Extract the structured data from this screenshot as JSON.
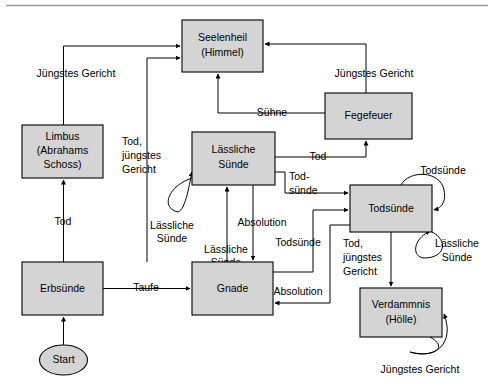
{
  "diagram": {
    "top_rule": true,
    "background_color": "#ffffff",
    "node_fill_color": "#d4d4d4",
    "node_stroke_color": "#000000",
    "edge_color": "#000000",
    "nodes": [
      {
        "id": "start",
        "shape": "ellipse",
        "lines": [
          "Start"
        ],
        "x": 40,
        "y": 345,
        "w": 47,
        "h": 30
      },
      {
        "id": "erbsuende",
        "shape": "rect",
        "lines": [
          "Erbsünde"
        ],
        "x": 22,
        "y": 262,
        "w": 81,
        "h": 53
      },
      {
        "id": "limbus",
        "shape": "rect",
        "lines": [
          "Limbus",
          "(Abrahams",
          "Schoss)"
        ],
        "x": 22,
        "y": 125,
        "w": 81,
        "h": 53
      },
      {
        "id": "seelenheil",
        "shape": "rect",
        "lines": [
          "Seelenheil",
          "(Himmel)"
        ],
        "x": 182,
        "y": 20,
        "w": 81,
        "h": 52
      },
      {
        "id": "fegefeuer",
        "shape": "rect",
        "lines": [
          "Fegefeuer"
        ],
        "x": 325,
        "y": 93,
        "w": 87,
        "h": 46
      },
      {
        "id": "laessliche",
        "shape": "rect",
        "lines": [
          "Lässliche",
          "Sünde"
        ],
        "x": 192,
        "y": 132,
        "w": 83,
        "h": 53
      },
      {
        "id": "gnade",
        "shape": "rect",
        "lines": [
          "Gnade"
        ],
        "x": 192,
        "y": 262,
        "w": 81,
        "h": 53
      },
      {
        "id": "todsuende",
        "shape": "rect",
        "lines": [
          "Todsünde"
        ],
        "x": 350,
        "y": 185,
        "w": 82,
        "h": 47
      },
      {
        "id": "verdammnis",
        "shape": "rect",
        "lines": [
          "Verdammnis",
          "(Hölle)"
        ],
        "x": 360,
        "y": 288,
        "w": 82,
        "h": 49
      }
    ],
    "edges": [
      {
        "id": "start-to-erbsuende",
        "from": "start",
        "to": "erbsuende",
        "label": ""
      },
      {
        "id": "erbsuende-to-limbus",
        "from": "erbsuende",
        "to": "limbus",
        "label": "Tod"
      },
      {
        "id": "limbus-to-seelenheil",
        "from": "limbus",
        "to": "seelenheil",
        "label": "Jüngstes Gericht"
      },
      {
        "id": "erbsuende-to-gnade",
        "from": "erbsuende",
        "to": "gnade",
        "label": "Taufe"
      },
      {
        "id": "gnade-to-seelenheil",
        "from": "gnade",
        "to": "seelenheil",
        "label": "Tod, jüngstes Gericht"
      },
      {
        "id": "gnade-to-laessliche",
        "from": "gnade",
        "to": "laessliche",
        "label": "Lässliche Sünde"
      },
      {
        "id": "laessliche-self",
        "from": "laessliche",
        "to": "laessliche",
        "label": "Lässliche Sünde"
      },
      {
        "id": "laessliche-to-gnade",
        "from": "laessliche",
        "to": "gnade",
        "label": "Absolution"
      },
      {
        "id": "laessliche-to-fegefeuer",
        "from": "laessliche",
        "to": "fegefeuer",
        "label": "Tod"
      },
      {
        "id": "laessliche-to-todsuende",
        "from": "laessliche",
        "to": "todsuende",
        "label": "Tod-sünde"
      },
      {
        "id": "fegefeuer-to-seelenheil",
        "from": "fegefeuer",
        "to": "seelenheil",
        "label": "Jüngstes Gericht"
      },
      {
        "id": "fegefeuer-to-seelenheil-suehne",
        "from": "fegefeuer",
        "to": "seelenheil",
        "label": "Sühne"
      },
      {
        "id": "gnade-to-todsuende",
        "from": "gnade",
        "to": "todsuende",
        "label": "Todsünde"
      },
      {
        "id": "todsuende-to-gnade",
        "from": "todsuende",
        "to": "gnade",
        "label": "Absolution"
      },
      {
        "id": "todsuende-self-top",
        "from": "todsuende",
        "to": "todsuende",
        "label": "Todsünde"
      },
      {
        "id": "todsuende-self-bottom",
        "from": "todsuende",
        "to": "todsuende",
        "label": "Lässliche Sünde"
      },
      {
        "id": "todsuende-to-verdammnis",
        "from": "todsuende",
        "to": "verdammnis",
        "label": "Tod, jüngstes Gericht"
      },
      {
        "id": "verdammnis-self",
        "from": "verdammnis",
        "to": "verdammnis",
        "label": "Jüngstes Gericht"
      }
    ],
    "labels": {
      "start": "Start",
      "erbsuende": "Erbsünde",
      "limbus_l1": "Limbus",
      "limbus_l2": "(Abrahams",
      "limbus_l3": "Schoss)",
      "seelenheil_l1": "Seelenheil",
      "seelenheil_l2": "(Himmel)",
      "fegefeuer": "Fegefeuer",
      "laessliche_l1": "Lässliche",
      "laessliche_l2": "Sünde",
      "gnade": "Gnade",
      "todsuende": "Todsünde",
      "verdammnis_l1": "Verdammnis",
      "verdammnis_l2": "(Hölle)",
      "edge_tod_left": "Tod",
      "edge_juengstes_gericht_left": "Jüngstes Gericht",
      "edge_taufe": "Taufe",
      "edge_tod_juengstes_l1": "Tod,",
      "edge_tod_juengstes_l2": "jüngstes",
      "edge_tod_juengstes_l3": "Gericht",
      "edge_laessliche_self_l1": "Lässliche",
      "edge_laessliche_self_l2": "Sünde",
      "edge_laessliche_up_l1": "Lässliche",
      "edge_laessliche_up_l2": "Sünde",
      "edge_absolution_mid": "Absolution",
      "edge_tod_right": "Tod",
      "edge_todsuende_hyphen_l1": "Tod-",
      "edge_todsuende_hyphen_l2": "sünde",
      "edge_juengstes_gericht_right": "Jüngstes Gericht",
      "edge_suehne": "Sühne",
      "edge_todsuende_mid": "Todsünde",
      "edge_absolution_low": "Absolution",
      "edge_todsuende_self_top": "Todsünde",
      "edge_laessliche_self_right_l1": "Lässliche",
      "edge_laessliche_self_right_l2": "Sünde",
      "edge_tod_juengstes_r_l1": "Tod,",
      "edge_tod_juengstes_r_l2": "jüngstes",
      "edge_tod_juengstes_r_l3": "Gericht",
      "edge_juengstes_gericht_bottom": "Jüngstes Gericht"
    }
  }
}
